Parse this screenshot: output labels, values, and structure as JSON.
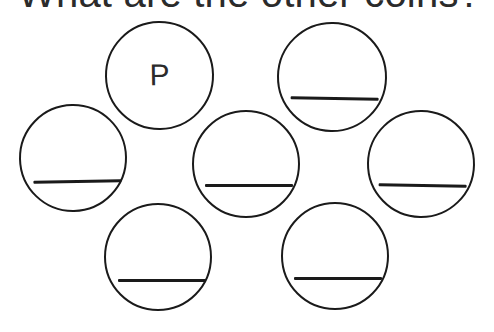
{
  "page": {
    "background_color": "#ffffff",
    "ink_color": "#1a1a1a",
    "text_color": "#2b2b2b"
  },
  "title": {
    "text": "What are the other coins?"
  },
  "coins": [
    {
      "id": "coin-top-left",
      "position": "top-left",
      "label": "P",
      "has_answer_line": false
    },
    {
      "id": "coin-top-right",
      "position": "top-right",
      "label": "",
      "has_answer_line": true
    },
    {
      "id": "coin-middle-left",
      "position": "middle-left",
      "label": "",
      "has_answer_line": true
    },
    {
      "id": "coin-middle-center",
      "position": "middle-center",
      "label": "",
      "has_answer_line": true
    },
    {
      "id": "coin-middle-right",
      "position": "middle-right",
      "label": "",
      "has_answer_line": true
    },
    {
      "id": "coin-bottom-left",
      "position": "bottom-left",
      "label": "",
      "has_answer_line": true
    },
    {
      "id": "coin-bottom-right",
      "position": "bottom-right",
      "label": "",
      "has_answer_line": true
    }
  ]
}
